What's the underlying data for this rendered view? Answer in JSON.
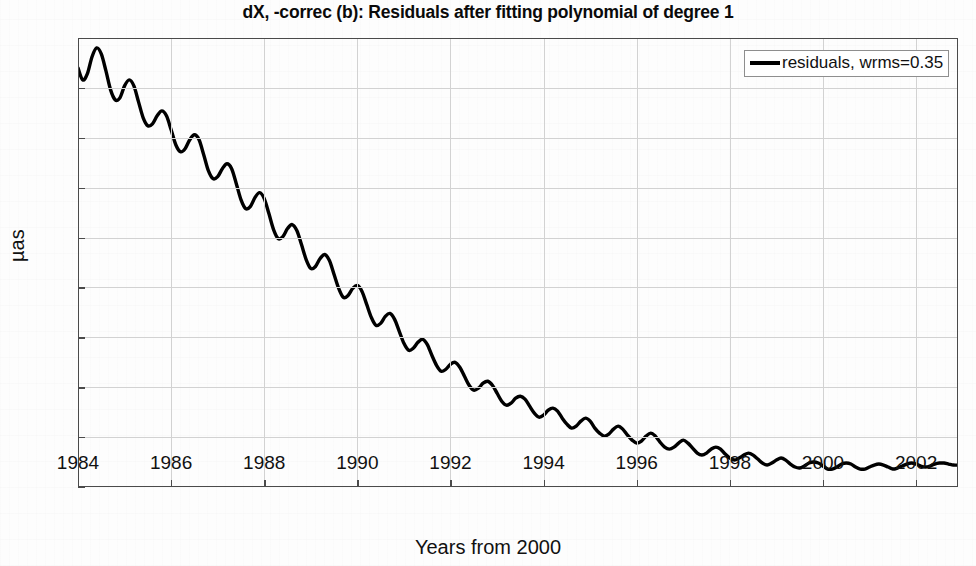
{
  "chart_data": {
    "type": "line",
    "title": "dX, -correc (b): Residuals after fitting polynomial of degree 1",
    "xlabel": "Years from 2000",
    "ylabel": "µas",
    "xlim": [
      1984,
      2002.9
    ],
    "ylim": [
      -1,
      3.5
    ],
    "xticks": [
      1984,
      1986,
      1988,
      1990,
      1992,
      1994,
      1996,
      1998,
      2000,
      2002
    ],
    "xtick_labels": [
      "1984",
      "1986",
      "1988",
      "1990",
      "1992",
      "1994",
      "1996",
      "1998",
      "2000",
      "2002"
    ],
    "yticks": [
      -1,
      -0.5,
      0,
      0.5,
      1,
      1.5,
      2,
      2.5,
      3,
      3.5
    ],
    "ytick_labels": [
      "-1",
      "-0.5",
      "0",
      "0.5",
      "1",
      "1.5",
      "2",
      "2.5",
      "3",
      "3.5"
    ],
    "grid": true,
    "legend_position": "top-right",
    "legend": [
      {
        "label": "residuals, wrms=0.35",
        "color": "#000000"
      }
    ],
    "series": [
      {
        "name": "residuals",
        "color": "#000000",
        "linewidth": 3.4,
        "description": "Declining then rising smooth trend with superimposed ~1-year period oscillation whose amplitude shrinks toward the middle of the record.",
        "x": [
          1984.0,
          1984.1,
          1984.2,
          1984.3,
          1984.4,
          1984.5,
          1984.6,
          1984.7,
          1984.8,
          1984.9,
          1985.0,
          1985.1,
          1985.2,
          1985.3,
          1985.4,
          1985.5,
          1985.6,
          1985.7,
          1985.8,
          1985.9,
          1986.0,
          1986.1,
          1986.2,
          1986.3,
          1986.4,
          1986.5,
          1986.6,
          1986.7,
          1986.8,
          1986.9,
          1987.0,
          1987.1,
          1987.2,
          1987.3,
          1987.4,
          1987.5,
          1987.6,
          1987.7,
          1987.8,
          1987.9,
          1988.0,
          1988.1,
          1988.2,
          1988.3,
          1988.4,
          1988.5,
          1988.6,
          1988.7,
          1988.8,
          1988.9,
          1989.0,
          1989.1,
          1989.2,
          1989.3,
          1989.4,
          1989.5,
          1989.6,
          1989.7,
          1989.8,
          1989.9,
          1990.0,
          1990.1,
          1990.2,
          1990.3,
          1990.4,
          1990.5,
          1990.6,
          1990.7,
          1990.8,
          1990.9,
          1991.0,
          1991.1,
          1991.2,
          1991.3,
          1991.4,
          1991.5,
          1991.6,
          1991.7,
          1991.8,
          1991.9,
          1992.0,
          1992.1,
          1992.2,
          1992.3,
          1992.4,
          1992.5,
          1992.6,
          1992.7,
          1992.8,
          1992.9,
          1993.0,
          1993.1,
          1993.2,
          1993.3,
          1993.4,
          1993.5,
          1993.6,
          1993.7,
          1993.8,
          1993.9,
          1994.0,
          1994.1,
          1994.2,
          1994.3,
          1994.4,
          1994.5,
          1994.6,
          1994.7,
          1994.8,
          1994.9,
          1995.0,
          1995.1,
          1995.2,
          1995.3,
          1995.4,
          1995.5,
          1995.6,
          1995.7,
          1995.8,
          1995.9,
          1996.0,
          1996.1,
          1996.2,
          1996.3,
          1996.4,
          1996.5,
          1996.6,
          1996.7,
          1996.8,
          1996.9,
          1997.0,
          1997.1,
          1997.2,
          1997.3,
          1997.4,
          1997.5,
          1997.6,
          1997.7,
          1997.8,
          1997.9,
          1998.0,
          1998.1,
          1998.2,
          1998.3,
          1998.4,
          1998.5,
          1998.6,
          1998.7,
          1998.8,
          1998.9,
          1999.0,
          1999.1,
          1999.2,
          1999.3,
          1999.4,
          1999.5,
          1999.6,
          1999.7,
          1999.8,
          1999.9,
          2000.0,
          2000.1,
          2000.2,
          2000.3,
          2000.4,
          2000.5,
          2000.6,
          2000.7,
          2000.8,
          2000.9,
          2001.0,
          2001.1,
          2001.2,
          2001.3,
          2001.4,
          2001.5,
          2001.6,
          2001.7,
          2001.8,
          2001.9,
          2002.0,
          2002.1,
          2002.2,
          2002.3,
          2002.4,
          2002.5,
          2002.6,
          2002.7,
          2002.8,
          2002.9
        ],
        "y": [
          3.2,
          3.08,
          3.14,
          3.31,
          3.4,
          3.34,
          3.17,
          2.98,
          2.88,
          2.9,
          3.02,
          3.08,
          3.02,
          2.86,
          2.7,
          2.62,
          2.64,
          2.72,
          2.77,
          2.72,
          2.58,
          2.43,
          2.36,
          2.39,
          2.48,
          2.53,
          2.48,
          2.33,
          2.17,
          2.09,
          2.11,
          2.19,
          2.24,
          2.19,
          2.04,
          1.88,
          1.79,
          1.81,
          1.9,
          1.95,
          1.89,
          1.74,
          1.58,
          1.49,
          1.51,
          1.59,
          1.63,
          1.57,
          1.43,
          1.28,
          1.19,
          1.21,
          1.29,
          1.33,
          1.27,
          1.13,
          0.99,
          0.9,
          0.92,
          0.99,
          1.02,
          0.96,
          0.83,
          0.7,
          0.62,
          0.64,
          0.71,
          0.74,
          0.68,
          0.56,
          0.44,
          0.37,
          0.39,
          0.45,
          0.48,
          0.43,
          0.32,
          0.22,
          0.16,
          0.18,
          0.23,
          0.25,
          0.2,
          0.11,
          0.02,
          -0.03,
          -0.01,
          0.04,
          0.06,
          0.02,
          -0.06,
          -0.14,
          -0.18,
          -0.16,
          -0.11,
          -0.09,
          -0.12,
          -0.19,
          -0.26,
          -0.3,
          -0.28,
          -0.23,
          -0.21,
          -0.24,
          -0.31,
          -0.37,
          -0.41,
          -0.39,
          -0.34,
          -0.31,
          -0.34,
          -0.41,
          -0.46,
          -0.49,
          -0.47,
          -0.42,
          -0.39,
          -0.42,
          -0.48,
          -0.53,
          -0.56,
          -0.54,
          -0.49,
          -0.46,
          -0.49,
          -0.55,
          -0.6,
          -0.62,
          -0.6,
          -0.56,
          -0.53,
          -0.56,
          -0.61,
          -0.66,
          -0.68,
          -0.66,
          -0.62,
          -0.6,
          -0.62,
          -0.67,
          -0.71,
          -0.73,
          -0.71,
          -0.68,
          -0.66,
          -0.68,
          -0.72,
          -0.76,
          -0.78,
          -0.76,
          -0.73,
          -0.71,
          -0.73,
          -0.77,
          -0.8,
          -0.81,
          -0.79,
          -0.76,
          -0.75,
          -0.76,
          -0.79,
          -0.82,
          -0.82,
          -0.8,
          -0.77,
          -0.76,
          -0.77,
          -0.8,
          -0.82,
          -0.82,
          -0.8,
          -0.78,
          -0.77,
          -0.78,
          -0.8,
          -0.82,
          -0.81,
          -0.79,
          -0.77,
          -0.76,
          -0.77,
          -0.79,
          -0.8,
          -0.79,
          -0.77,
          -0.76,
          -0.76,
          -0.77,
          -0.78,
          -0.78
        ]
      }
    ],
    "key_points": {
      "start_value": 3.2,
      "first_peak": 3.4,
      "minimum_value": -0.82,
      "minimum_year": 1991.7,
      "maximum_late_value": 0.33,
      "maximum_late_year": 1998.2,
      "end_value": -0.42
    }
  },
  "legend": {
    "label": "residuals, wrms=0.35"
  }
}
